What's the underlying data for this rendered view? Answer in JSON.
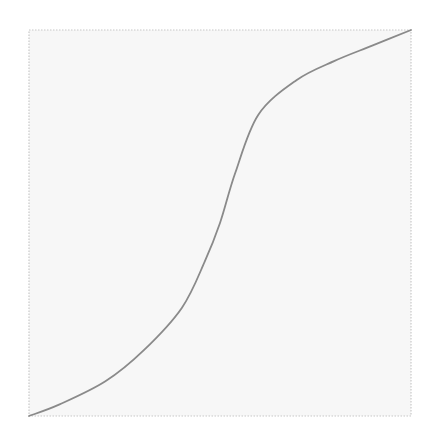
{
  "chart_data": {
    "type": "line",
    "title": "",
    "xlabel": "",
    "ylabel": "",
    "grid": false,
    "legend": null,
    "xlim": [
      0,
      1
    ],
    "ylim": [
      0,
      1
    ],
    "series": [
      {
        "name": "curve",
        "x": [
          0.0,
          0.08,
          0.2,
          0.3,
          0.4,
          0.46,
          0.5,
          0.54,
          0.6,
          0.7,
          0.8,
          0.9,
          1.0
        ],
        "y": [
          0.0,
          0.03,
          0.09,
          0.17,
          0.28,
          0.4,
          0.5,
          0.63,
          0.78,
          0.87,
          0.92,
          0.96,
          1.0
        ]
      }
    ],
    "frame": {
      "left": 29,
      "top": 30,
      "right": 411,
      "bottom": 416
    },
    "colors": {
      "frame_fill": "#f7f7f7",
      "frame_border": "#c8c8c8",
      "line": "#8a8a8a"
    }
  }
}
